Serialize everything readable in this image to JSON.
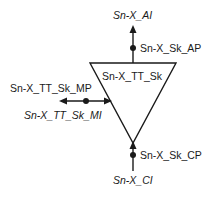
{
  "diagram": {
    "function_name": "Sn-X_TT_Sk",
    "top_signal": "Sn-X_AI",
    "top_point": "Sn-X_Sk_AP",
    "mgmt_point": "Sn-X_TT_Sk_MP",
    "mgmt_signal": "Sn-X_TT_Sk_MI",
    "bottom_point": "Sn-X_Sk_CP",
    "bottom_signal": "Sn-X_CI",
    "colors": {
      "line": "#1a1a1a",
      "background": "#ffffff"
    }
  }
}
